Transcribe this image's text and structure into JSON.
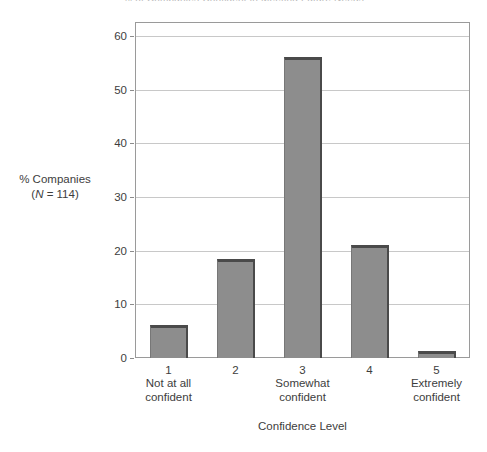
{
  "chart_data": {
    "type": "bar",
    "title": "Confidence Level",
    "xlabel": "Confidence Level",
    "ylabel_line1": "% Companies",
    "ylabel_line2_prefix": "(",
    "ylabel_line2_italic": "N",
    "ylabel_line2_suffix": " = 114)",
    "categories": [
      "1",
      "2",
      "3",
      "4",
      "5"
    ],
    "category_descriptions": [
      "Not at all\nconfident",
      "",
      "Somewhat\nconfident",
      "",
      "Extremely\nconfident"
    ],
    "values": [
      6.1,
      18.4,
      56.1,
      21.1,
      1.3
    ],
    "ylim": [
      0,
      60
    ],
    "yticks": [
      0,
      10,
      20,
      30,
      40,
      50,
      60
    ],
    "ytick_labels": [
      "0",
      "10",
      "20",
      "30",
      "40",
      "50",
      "60"
    ],
    "grid": true,
    "legend": "none",
    "bar_color": "#8d8d8d",
    "bar_edge_color": "#4a4a4a",
    "frame_color": "#9a9a9a",
    "gridline_color": "#c8c8c8",
    "text_color": "#3d3d3d"
  },
  "clipped_header": "% of Companies Confident in Meeting Future Needs"
}
